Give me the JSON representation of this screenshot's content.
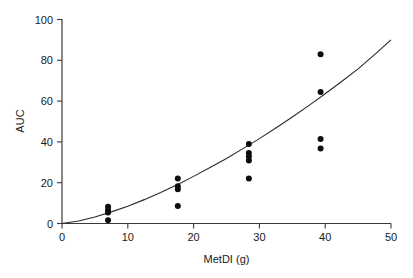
{
  "chart_data": {
    "type": "scatter",
    "title": "",
    "xlabel": "MetDI (g)",
    "ylabel": "AUC",
    "xlim": [
      0,
      50
    ],
    "ylim": [
      0,
      100
    ],
    "xticks": [
      0,
      10,
      20,
      30,
      40,
      50
    ],
    "yticks": [
      0,
      20,
      40,
      60,
      80,
      100
    ],
    "xticklabels": [
      "0",
      "10",
      "20",
      "30",
      "40",
      "50"
    ],
    "yticklabels": [
      "0",
      "20",
      "40",
      "60",
      "80",
      "100"
    ],
    "grid": false,
    "legend": false,
    "legend_position": "none",
    "marker": "filled-circle",
    "marker_color": "#0d0d0d",
    "marker_size": 5,
    "points": [
      {
        "x": 7.0,
        "y": 8.2
      },
      {
        "x": 7.0,
        "y": 6.6
      },
      {
        "x": 7.0,
        "y": 5.4
      },
      {
        "x": 7.0,
        "y": 1.6
      },
      {
        "x": 17.6,
        "y": 22.0
      },
      {
        "x": 17.6,
        "y": 18.3
      },
      {
        "x": 17.6,
        "y": 16.8
      },
      {
        "x": 17.6,
        "y": 8.6
      },
      {
        "x": 28.4,
        "y": 39.0
      },
      {
        "x": 28.4,
        "y": 34.5
      },
      {
        "x": 28.4,
        "y": 32.8
      },
      {
        "x": 28.4,
        "y": 30.9
      },
      {
        "x": 28.4,
        "y": 22.0
      },
      {
        "x": 39.3,
        "y": 83.0
      },
      {
        "x": 39.3,
        "y": 64.5
      },
      {
        "x": 39.3,
        "y": 41.4
      },
      {
        "x": 39.3,
        "y": 36.8
      }
    ],
    "series": [
      {
        "name": "fitted curve",
        "type": "line",
        "color": "#2a2a2a",
        "x": [
          0,
          2.5,
          5,
          7.5,
          10,
          12.5,
          15,
          17.5,
          20,
          22.5,
          25,
          27.5,
          30,
          32.5,
          35,
          37.5,
          40,
          42.5,
          45,
          47.5,
          50
        ],
        "y": [
          0.0,
          1.2,
          3.2,
          5.7,
          8.5,
          11.7,
          15.2,
          19.0,
          23.1,
          27.4,
          31.9,
          36.7,
          41.6,
          46.8,
          52.2,
          57.8,
          63.6,
          69.6,
          75.8,
          82.8,
          90.0
        ]
      }
    ]
  }
}
